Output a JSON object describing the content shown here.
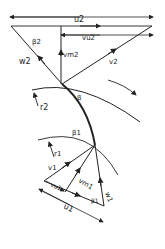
{
  "diagram": {
    "type": "velocity-triangles",
    "outlet": {
      "labels": {
        "u2": "u2",
        "vu2": "vu2",
        "beta2": "β2",
        "vm2": "vm2",
        "w2": "w2",
        "v2": "v2",
        "r2": "r2"
      }
    },
    "blade": {
      "label": "β"
    },
    "inlet": {
      "labels": {
        "beta1_top": "β1",
        "r1": "r1",
        "v1": "v1",
        "vu1": "vu1",
        "vm1": "vm1",
        "u1": "u1",
        "beta1": "β1",
        "w1": "w1"
      }
    },
    "stroke_color": "#222222",
    "background": "#ffffff"
  }
}
